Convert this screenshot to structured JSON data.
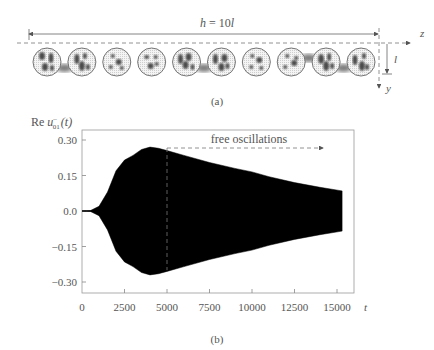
{
  "panel_a": {
    "label": "(a)",
    "span_label_var": "h",
    "span_label_eq": " = 10",
    "span_label_unit": "l",
    "axis_z": "z",
    "axis_y": "y",
    "cell_height_label": "l",
    "particle_count": 10
  },
  "panel_b": {
    "label": "(b)",
    "annotation": "free oscillations"
  },
  "chart_data": {
    "type": "area",
    "title": "",
    "ylabel": "Re u⁻₀₁(t)",
    "ylabel_parts": {
      "prefix": "Re ",
      "var": "u",
      "sup": "–",
      "sub": "01",
      "arg": "(t)"
    },
    "xlabel": "t",
    "xlim": [
      0,
      15800
    ],
    "ylim": [
      -0.345,
      0.345
    ],
    "xticks": [
      0,
      2500,
      5000,
      7500,
      10000,
      12500,
      15000
    ],
    "xtick_labels": [
      "0",
      "2500",
      "5000",
      "7500",
      "10000",
      "12500",
      "15000"
    ],
    "yticks": [
      0.3,
      0.15,
      0.0,
      -0.15,
      -0.3
    ],
    "ytick_labels": [
      "0.30",
      "0.15",
      "0.0",
      "−0.15",
      "−0.30"
    ],
    "grid": false,
    "legend": null,
    "envelope": {
      "t": [
        0,
        500,
        1000,
        1500,
        2000,
        2500,
        3000,
        3500,
        4000,
        4500,
        5000,
        6000,
        7500,
        9000,
        10000,
        11000,
        12500,
        14000,
        15300
      ],
      "amp": [
        0,
        0.002,
        0.02,
        0.08,
        0.17,
        0.215,
        0.235,
        0.26,
        0.27,
        0.265,
        0.255,
        0.235,
        0.205,
        0.18,
        0.165,
        0.145,
        0.12,
        0.1,
        0.085
      ]
    },
    "annotations": [
      {
        "text": "free oscillations",
        "t_start": 5000,
        "t_end": 15000,
        "arrow": "right",
        "style": "dashed"
      },
      {
        "type": "vline",
        "t": 5000,
        "style": "dashed",
        "from_amp": -0.25,
        "to_amp": 0.27
      }
    ]
  },
  "colors": {
    "signal": "#000000",
    "axes": "#888888",
    "text": "#555555",
    "particle_blob": "#4a4a4a"
  }
}
